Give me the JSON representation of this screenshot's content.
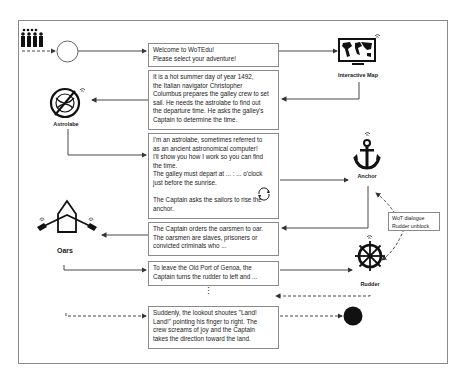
{
  "diagram": {
    "steps": [
      {
        "id": "welcome",
        "text": "Welcome to WoTEdu!\nPlease select your adventure!"
      },
      {
        "id": "intro",
        "text": "It is a hot summer day of year 1492,\nthe Italian navigator Christopher\nColumbus prepares the galley crew to set\nsail. He needs the astrolabe to find out\nthe departure time. He asks the galley's\nCaptain to determine the time."
      },
      {
        "id": "astrolabe-talk",
        "text": "I'm an astrolabe, sometimes referred to\nas an ancient astronomical computer!\nI'll show you how I work so you can find\nthe time.\nThe galley must depart at ... : ... o'clock\njust before the sunrise.\n\nThe Captain asks the sailors to rise the\nanchor."
      },
      {
        "id": "oarsmen",
        "text": "The Captain orders the oarsmen to oar.\nThe oarsmen are slaves, prisoners or\nconvicted criminals who ..."
      },
      {
        "id": "rudder-turn",
        "text": "To leave the Old Port of Genoa, the\nCaptain turns the rudder to left and ..."
      },
      {
        "id": "land",
        "text": "Suddenly, the lookout shoutes \"Land!\nLand!\" pointing his finger to right. The\ncrew screams of joy and the Captain\ntakes the direction toward the land."
      }
    ],
    "ellipsis": "⋮",
    "objects": {
      "map": "Interactive Map",
      "astrolabe": "Astrolabe",
      "anchor": "Anchor",
      "oars": "Oars",
      "rudder": "Rudder"
    },
    "wot_dialogue": "WoT dialogue\nRudder unblock",
    "colors": {
      "line": "#333333",
      "border": "#8a8a8a",
      "icon": "#111111"
    }
  }
}
